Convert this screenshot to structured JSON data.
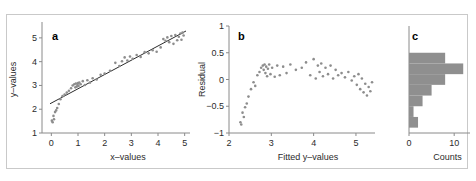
{
  "figure": {
    "width": 476,
    "height": 181,
    "background": "#ffffff",
    "border_color": "#c9c9c9",
    "point_color": "#8d8d8d",
    "line_color": "#2b2b2b",
    "bar_color": "#8f8f8f",
    "axis_color": "#8a8a8a"
  },
  "chart_data": [
    {
      "type": "scatter",
      "panel_label": "a",
      "title": "",
      "xlabel": "x–values",
      "ylabel": "y–values",
      "xlim": [
        -0.35,
        5.2
      ],
      "ylim": [
        1.0,
        5.5
      ],
      "xticks": [
        0,
        1,
        2,
        3,
        4,
        5
      ],
      "xticklabels": [
        "0",
        "1",
        "2",
        "3",
        "4",
        "5"
      ],
      "yticks": [
        1,
        2,
        3,
        4,
        5
      ],
      "yticklabels": [
        "1",
        "2",
        "3",
        "4",
        "5"
      ],
      "grid": false,
      "legend": "none",
      "fit_line": {
        "label": "least-squares fit",
        "intercept": 2.26,
        "slope": 0.6,
        "x_start": -0.05,
        "x_end": 5.05
      },
      "x": [
        0.02,
        0.05,
        0.08,
        0.1,
        0.14,
        0.18,
        0.22,
        0.28,
        0.34,
        0.42,
        0.5,
        0.58,
        0.66,
        0.74,
        0.8,
        0.86,
        0.9,
        0.92,
        0.95,
        0.98,
        1.0,
        1.02,
        1.05,
        1.1,
        1.18,
        1.26,
        1.35,
        1.45,
        1.55,
        1.7,
        1.85,
        2.0,
        2.2,
        2.4,
        2.55,
        2.65,
        2.75,
        2.85,
        2.95,
        3.05,
        3.2,
        3.35,
        3.5,
        3.65,
        3.8,
        3.95,
        4.1,
        4.2,
        4.28,
        4.35,
        4.42,
        4.5,
        4.58,
        4.65,
        4.72,
        4.78,
        4.84,
        4.88,
        4.92,
        4.96
      ],
      "y": [
        1.52,
        1.45,
        1.72,
        1.58,
        1.88,
        1.95,
        2.05,
        2.22,
        2.42,
        2.55,
        2.62,
        2.7,
        2.78,
        2.88,
        3.0,
        3.05,
        2.92,
        3.08,
        2.95,
        3.02,
        3.1,
        2.98,
        3.12,
        3.05,
        3.18,
        3.02,
        3.22,
        3.12,
        3.3,
        3.25,
        3.45,
        3.5,
        3.62,
        3.95,
        3.82,
        4.02,
        4.18,
        4.05,
        4.22,
        4.12,
        4.28,
        4.2,
        4.4,
        4.35,
        4.48,
        4.42,
        4.6,
        4.95,
        4.88,
        5.02,
        4.82,
        5.08,
        4.75,
        5.12,
        4.9,
        5.05,
        5.18,
        4.92,
        5.22,
        5.1
      ]
    },
    {
      "type": "scatter",
      "panel_label": "b",
      "title": "",
      "xlabel": "Fitted y–values",
      "ylabel": "Residual",
      "xlim": [
        2.0,
        5.45
      ],
      "ylim": [
        -1.0,
        1.0
      ],
      "xticks": [
        2,
        3,
        4,
        5
      ],
      "xticklabels": [
        "2",
        "3",
        "4",
        "5"
      ],
      "yticks": [
        -1,
        -0.5,
        0,
        0.5,
        1
      ],
      "yticklabels": [
        "−1",
        "−0.5",
        "0",
        "0.5",
        "1"
      ],
      "grid": false,
      "legend": "none",
      "x": [
        2.27,
        2.29,
        2.32,
        2.35,
        2.38,
        2.42,
        2.46,
        2.52,
        2.58,
        2.62,
        2.67,
        2.72,
        2.76,
        2.8,
        2.82,
        2.84,
        2.86,
        2.88,
        2.9,
        2.92,
        2.95,
        2.98,
        3.02,
        3.08,
        3.14,
        3.2,
        3.28,
        3.36,
        3.45,
        3.58,
        3.72,
        3.82,
        3.92,
        4.0,
        4.05,
        4.1,
        4.14,
        4.18,
        4.22,
        4.28,
        4.34,
        4.4,
        4.46,
        4.52,
        4.58,
        4.66,
        4.74,
        4.82,
        4.9,
        4.96,
        5.02,
        5.06,
        5.1,
        5.14,
        5.18,
        5.22,
        5.26,
        5.3,
        5.34,
        5.38
      ],
      "y": [
        -0.8,
        -0.84,
        -0.62,
        -0.7,
        -0.52,
        -0.45,
        -0.32,
        -0.18,
        -0.05,
        -0.12,
        0.08,
        0.14,
        0.22,
        0.26,
        0.18,
        0.28,
        0.12,
        0.24,
        0.06,
        0.2,
        0.28,
        0.1,
        0.22,
        0.05,
        0.26,
        0.08,
        0.24,
        0.12,
        0.28,
        0.18,
        0.22,
        0.32,
        0.08,
        0.38,
        0.02,
        0.26,
        0.14,
        0.3,
        0.06,
        0.22,
        0.1,
        0.26,
        0.02,
        0.18,
        0.08,
        0.12,
        0.04,
        0.14,
        -0.02,
        0.06,
        -0.1,
        0.1,
        -0.18,
        0.02,
        -0.24,
        -0.08,
        -0.3,
        -0.14,
        -0.22,
        -0.05
      ]
    },
    {
      "type": "bar",
      "orientation": "horizontal",
      "panel_label": "c",
      "title": "",
      "xlabel": "Counts",
      "ylabel": "",
      "xlim": [
        0,
        13.5
      ],
      "ylim": [
        -1.0,
        1.0
      ],
      "xticks": [
        0,
        10
      ],
      "xticklabels": [
        "0",
        "10"
      ],
      "grid": false,
      "legend": "none",
      "bin_edges": [
        -0.9,
        -0.7,
        -0.5,
        -0.3,
        -0.1,
        0.1,
        0.3,
        0.5
      ],
      "categories": [
        "-0.9 to -0.7",
        "-0.7 to -0.5",
        "-0.5 to -0.3",
        "-0.3 to -0.1",
        "-0.1 to 0.1",
        "0.1 to 0.3",
        "0.3 to 0.5"
      ],
      "values": [
        2,
        1,
        3,
        5,
        8,
        12,
        8
      ]
    }
  ]
}
